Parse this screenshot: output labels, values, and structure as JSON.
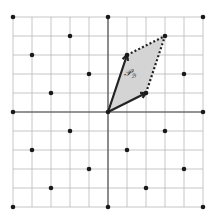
{
  "diagram": {
    "type": "lattice-fundamental-parallelogram",
    "label_main": "𝒫",
    "label_sub": "ℬ",
    "grid": {
      "min": -5,
      "max": 5,
      "step": 1
    },
    "basis": [
      [
        2,
        1
      ],
      [
        1,
        3
      ]
    ],
    "parallelogram": [
      [
        0,
        0
      ],
      [
        2,
        1
      ],
      [
        3,
        4
      ],
      [
        1,
        3
      ]
    ],
    "lattice_points": [
      [
        -5,
        5
      ],
      [
        0,
        5
      ],
      [
        5,
        5
      ],
      [
        -2,
        4
      ],
      [
        3,
        4
      ],
      [
        -4,
        3
      ],
      [
        1,
        3
      ],
      [
        -1,
        2
      ],
      [
        4,
        2
      ],
      [
        -3,
        1
      ],
      [
        2,
        1
      ],
      [
        -5,
        0
      ],
      [
        0,
        0
      ],
      [
        5,
        0
      ],
      [
        -2,
        -1
      ],
      [
        3,
        -1
      ],
      [
        -4,
        -2
      ],
      [
        1,
        -2
      ],
      [
        -1,
        -3
      ],
      [
        4,
        -3
      ],
      [
        -3,
        -4
      ],
      [
        2,
        -4
      ],
      [
        -5,
        -5
      ],
      [
        0,
        -5
      ],
      [
        5,
        -5
      ]
    ],
    "colors": {
      "fill": "#d4d4d4",
      "grid": "#b8b8b8",
      "ink": "#1a1a1a"
    }
  }
}
